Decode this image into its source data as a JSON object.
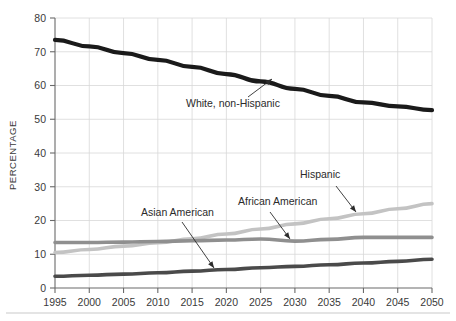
{
  "chart_data": {
    "type": "line",
    "title": "",
    "subtitle": "",
    "xlabel": "",
    "ylabel": "PERCENTAGE",
    "xlim": [
      1995,
      2050
    ],
    "ylim": [
      0,
      80
    ],
    "grid": true,
    "legend_position": "inline-annotations",
    "x": [
      1995,
      2000,
      2005,
      2010,
      2015,
      2020,
      2025,
      2030,
      2035,
      2040,
      2045,
      2050
    ],
    "xticks": [
      "1995",
      "2000",
      "2005",
      "2010",
      "2015",
      "2020",
      "2025",
      "2030",
      "2035",
      "2040",
      "2045",
      "2050"
    ],
    "yticks": [
      "0",
      "10",
      "20",
      "30",
      "40",
      "50",
      "60",
      "70",
      "80"
    ],
    "series": [
      {
        "name": "White, non-Hispanic",
        "color": "#1a1a1a",
        "width": 4.2,
        "values": [
          73.5,
          71.6,
          69.6,
          67.6,
          65.5,
          63.4,
          61.2,
          59.0,
          56.9,
          55.0,
          53.8,
          52.7
        ]
      },
      {
        "name": "Hispanic",
        "color": "#c3c3c3",
        "width": 3.6,
        "values": [
          10.5,
          11.4,
          12.4,
          13.4,
          14.6,
          16.0,
          17.5,
          19.0,
          20.5,
          22.0,
          23.5,
          25.0
        ]
      },
      {
        "name": "African American",
        "color": "#8f8f8f",
        "width": 3.6,
        "values": [
          13.5,
          13.5,
          13.6,
          13.8,
          14.0,
          14.2,
          14.5,
          13.9,
          14.4,
          15.0,
          15.0,
          15.0
        ]
      },
      {
        "name": "Asian American",
        "color": "#4a4a4a",
        "width": 3.6,
        "values": [
          3.5,
          3.8,
          4.1,
          4.5,
          5.0,
          5.5,
          6.0,
          6.4,
          6.9,
          7.4,
          7.9,
          8.5
        ]
      }
    ],
    "annotations": [
      {
        "label": "White, non-Hispanic",
        "series": "White, non-Hispanic",
        "text_x": 186,
        "text_y": 107,
        "line_from_x": 248,
        "line_from_y": 97,
        "line_to_x": 272,
        "line_to_y": 79
      },
      {
        "label": "Asian American",
        "series": "Asian American",
        "text_x": 141,
        "text_y": 216,
        "line_from_x": 182,
        "line_from_y": 222,
        "line_to_x": 214,
        "line_to_y": 268
      },
      {
        "label": "African American",
        "series": "African American",
        "text_x": 238,
        "text_y": 205,
        "line_from_x": 270,
        "line_from_y": 212,
        "line_to_x": 290,
        "line_to_y": 239
      },
      {
        "label": "Hispanic",
        "series": "Hispanic",
        "text_x": 300,
        "text_y": 178,
        "line_from_x": 336,
        "line_from_y": 186,
        "line_to_x": 356,
        "line_to_y": 212
      }
    ]
  },
  "axes": {
    "y_title": "PERCENTAGE"
  }
}
